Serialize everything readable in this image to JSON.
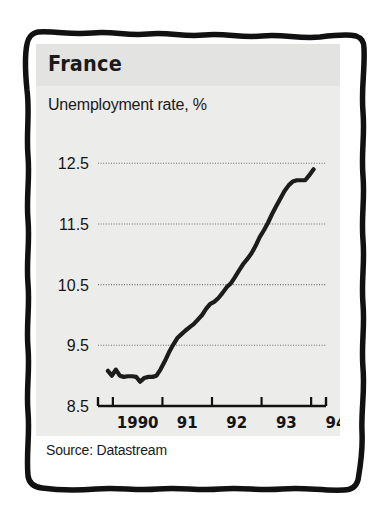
{
  "figure": {
    "title": "France",
    "subtitle": "Unemployment rate, %",
    "source": "Source: Datastream",
    "colors": {
      "line": "#1c1c1c",
      "panel_tint": "#ececeb",
      "header_tint": "#e3e3e2",
      "gridline": "#6d6d6d",
      "axis": "#111111",
      "text": "#1a1a1a",
      "border": "#111111",
      "background": "#ffffff"
    }
  },
  "chart_data": {
    "type": "line",
    "title": "France",
    "subtitle": "Unemployment rate, %",
    "xlabel": "",
    "ylabel": "Unemployment rate, %",
    "source": "Source: Datastream",
    "grid": true,
    "legend": false,
    "ylim": [
      8.5,
      12.9
    ],
    "xlim": [
      1989.7,
      1994.3
    ],
    "yticks": [
      "12.5",
      "11.5",
      "10.5",
      "9.5",
      "8.5"
    ],
    "ytick_values": [
      12.5,
      11.5,
      10.5,
      9.5,
      8.5
    ],
    "gridline_values": [
      12.5,
      11.5,
      10.5,
      9.5
    ],
    "xticks": [
      "1990",
      "91",
      "92",
      "93",
      "94"
    ],
    "xtick_values": [
      1990,
      1991,
      1992,
      1993,
      1994
    ],
    "series": [
      {
        "name": "Unemployment rate",
        "x": [
          1989.9,
          1989.98,
          1990.06,
          1990.14,
          1990.22,
          1990.3,
          1990.39,
          1990.47,
          1990.55,
          1990.63,
          1990.72,
          1990.8,
          1990.88,
          1990.96,
          1991.05,
          1991.13,
          1991.21,
          1991.3,
          1991.38,
          1991.46,
          1991.55,
          1991.63,
          1991.71,
          1991.8,
          1991.88,
          1991.96,
          1992.05,
          1992.13,
          1992.21,
          1992.3,
          1992.38,
          1992.46,
          1992.55,
          1992.63,
          1992.71,
          1992.8,
          1992.88,
          1992.96,
          1993.05,
          1993.13,
          1993.21,
          1993.3,
          1993.38,
          1993.46,
          1993.55,
          1993.63,
          1993.71,
          1993.8,
          1993.88,
          1993.96,
          1994.05
        ],
        "y": [
          9.08,
          9.0,
          9.1,
          9.0,
          8.98,
          8.99,
          8.99,
          8.98,
          8.9,
          8.96,
          8.98,
          8.98,
          9.0,
          9.1,
          9.24,
          9.38,
          9.5,
          9.62,
          9.68,
          9.74,
          9.8,
          9.85,
          9.92,
          10.0,
          10.1,
          10.18,
          10.22,
          10.28,
          10.36,
          10.46,
          10.52,
          10.62,
          10.74,
          10.84,
          10.92,
          11.02,
          11.14,
          11.28,
          11.4,
          11.52,
          11.66,
          11.8,
          11.92,
          12.04,
          12.14,
          12.2,
          12.22,
          12.22,
          12.22,
          12.3,
          12.4
        ]
      }
    ],
    "annotations": []
  }
}
